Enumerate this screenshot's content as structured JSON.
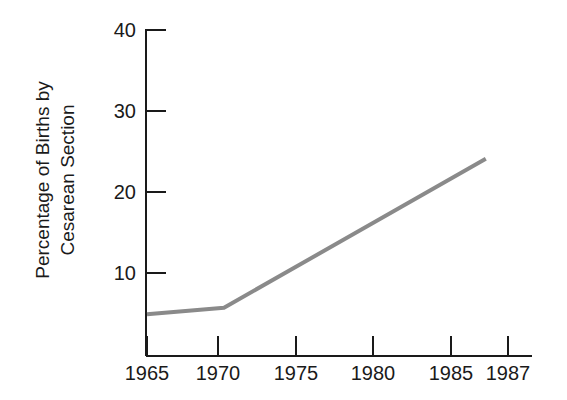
{
  "chart_data": {
    "type": "line",
    "title": "",
    "xlabel": "",
    "ylabel": "Percentage of Births by Cesarean Section",
    "ylabel_lines": [
      "Percentage of Births by",
      "Cesarean Section"
    ],
    "x": [
      1965,
      1970,
      1987
    ],
    "values": [
      4.7,
      5.5,
      24.0
    ],
    "series": [
      {
        "name": "Percentage of Births by Cesarean Section",
        "x": [
          1965,
          1970,
          1987
        ],
        "values": [
          4.7,
          5.5,
          24.0
        ]
      }
    ],
    "xlim": [
      1965,
      1990
    ],
    "ylim": [
      0,
      40
    ],
    "xticks": [
      1965,
      1970,
      1975,
      1980,
      1985,
      1987
    ],
    "xticklabels": [
      "1965",
      "1970",
      "1975",
      "1980",
      "1985",
      "1987"
    ],
    "yticks": [
      10,
      20,
      30,
      40
    ],
    "yticklabels": [
      "10",
      "20",
      "30",
      "40"
    ],
    "grid": false,
    "legend": false,
    "legend_position": "none",
    "line_color": "#8a8a8a",
    "axis_color": "#1a1a1a",
    "background_color": "#ffffff",
    "annotations": []
  },
  "axis": {
    "y_tick_labels": [
      "40",
      "30",
      "20",
      "10"
    ],
    "x_tick_labels": [
      "1965",
      "1970",
      "1975",
      "1980",
      "1985",
      "1987"
    ]
  }
}
